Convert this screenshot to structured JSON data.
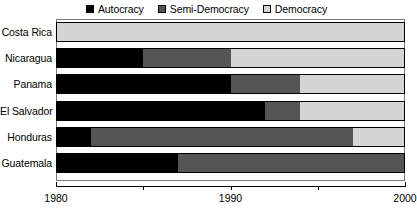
{
  "chart_data": {
    "type": "bar",
    "orientation": "horizontal-stacked-timeline",
    "title": "",
    "xlabel": "",
    "ylabel": "",
    "xlim": [
      1980,
      2000
    ],
    "grid": false,
    "legend_position": "top-center",
    "legend": [
      {
        "name": "Autocracy",
        "color": "#000000",
        "swatch": "filled-black-square"
      },
      {
        "name": "Semi-Democracy",
        "color": "#555555",
        "swatch": "filled-gray-square"
      },
      {
        "name": "Democracy",
        "color": "#d4d4d4",
        "swatch": "open-light-square"
      }
    ],
    "categories": [
      "Costa Rica",
      "Nicaragua",
      "Panama",
      "El Salvador",
      "Honduras",
      "Guatemala"
    ],
    "axis_ticks": [
      {
        "value": 1980,
        "label": "1980",
        "major": true
      },
      {
        "value": 1985,
        "label": "",
        "major": false
      },
      {
        "value": 1990,
        "label": "1990",
        "major": true
      },
      {
        "value": 1995,
        "label": "",
        "major": false
      },
      {
        "value": 2000,
        "label": "2000",
        "major": true
      }
    ],
    "series": [
      {
        "name": "Costa Rica",
        "segments": [
          {
            "regime": "Democracy",
            "start": 1980,
            "end": 2000,
            "color": "#d4d4d4"
          }
        ]
      },
      {
        "name": "Nicaragua",
        "segments": [
          {
            "regime": "Autocracy",
            "start": 1980,
            "end": 1985,
            "color": "#000000"
          },
          {
            "regime": "Semi-Democracy",
            "start": 1985,
            "end": 1990,
            "color": "#555555"
          },
          {
            "regime": "Democracy",
            "start": 1990,
            "end": 2000,
            "color": "#d4d4d4"
          }
        ]
      },
      {
        "name": "Panama",
        "segments": [
          {
            "regime": "Autocracy",
            "start": 1980,
            "end": 1990,
            "color": "#000000"
          },
          {
            "regime": "Semi-Democracy",
            "start": 1990,
            "end": 1994,
            "color": "#555555"
          },
          {
            "regime": "Democracy",
            "start": 1994,
            "end": 2000,
            "color": "#d4d4d4"
          }
        ]
      },
      {
        "name": "El Salvador",
        "segments": [
          {
            "regime": "Autocracy",
            "start": 1980,
            "end": 1992,
            "color": "#000000"
          },
          {
            "regime": "Semi-Democracy",
            "start": 1992,
            "end": 1994,
            "color": "#555555"
          },
          {
            "regime": "Democracy",
            "start": 1994,
            "end": 2000,
            "color": "#d4d4d4"
          }
        ]
      },
      {
        "name": "Honduras",
        "segments": [
          {
            "regime": "Autocracy",
            "start": 1980,
            "end": 1982,
            "color": "#000000"
          },
          {
            "regime": "Semi-Democracy",
            "start": 1982,
            "end": 1997,
            "color": "#555555"
          },
          {
            "regime": "Democracy",
            "start": 1997,
            "end": 2000,
            "color": "#d4d4d4"
          }
        ]
      },
      {
        "name": "Guatemala",
        "segments": [
          {
            "regime": "Autocracy",
            "start": 1980,
            "end": 1987,
            "color": "#000000"
          },
          {
            "regime": "Semi-Democracy",
            "start": 1987,
            "end": 2000,
            "color": "#555555"
          }
        ]
      }
    ]
  }
}
